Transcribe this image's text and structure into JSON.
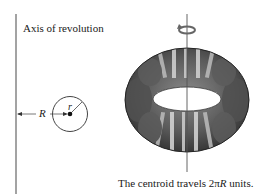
{
  "diagram": {
    "axis_label": "Axis of revolution",
    "radius_small_label": "r",
    "distance_label": "R",
    "caption_prefix": "The centroid travels 2π",
    "caption_var": "R",
    "caption_suffix": " units.",
    "icons": {
      "rotation": "rotation-arrow-icon"
    },
    "colors": {
      "line": "#555555",
      "torus_dark": "#3a3a3a",
      "torus_mid": "#6e6e6e",
      "torus_light": "#c8c8c8",
      "text": "#1a1a1a"
    }
  }
}
